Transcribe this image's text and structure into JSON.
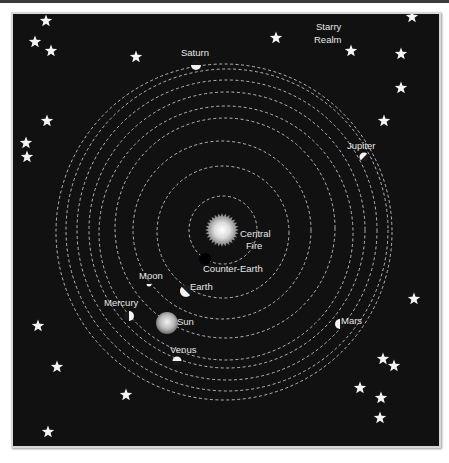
{
  "colors": {
    "background": "#111111",
    "frame": "#d8d8d8",
    "orbit": "#d0d0d0",
    "star": "#f4f4f4",
    "label": "#e6e6e6"
  },
  "labels": {
    "central_fire": [
      "Central",
      "Fire"
    ],
    "counter_earth": "Counter-Earth",
    "moon": "Moon",
    "earth": "Earth",
    "mercury": "Mercury",
    "sun": "Sun",
    "venus": "Venus",
    "mars": "Mars",
    "jupiter": "Jupiter",
    "saturn": "Saturn",
    "starry_realm": [
      "Starry",
      "Realm"
    ]
  },
  "orbits": [
    {
      "body": "counter-earth",
      "cx": 223,
      "cy": 230,
      "r": 34
    },
    {
      "body": "moon",
      "cx": 223,
      "cy": 232,
      "r": 66
    },
    {
      "body": "earth",
      "cx": 222,
      "cy": 230,
      "r": 89
    },
    {
      "body": "mercury",
      "cx": 225,
      "cy": 228,
      "r": 110
    },
    {
      "body": "sun",
      "cx": 226,
      "cy": 233,
      "r": 127
    },
    {
      "body": "venus",
      "cx": 227,
      "cy": 230,
      "r": 138
    },
    {
      "body": "mars",
      "cx": 227,
      "cy": 230,
      "r": 150
    },
    {
      "body": "jupiter",
      "cx": 227,
      "cy": 230,
      "r": 161
    },
    {
      "body": "saturn",
      "cx": 224,
      "cy": 232,
      "r": 168
    }
  ],
  "stars": [
    [
      46,
      21
    ],
    [
      35,
      42
    ],
    [
      51,
      51
    ],
    [
      136,
      57
    ],
    [
      276,
      38
    ],
    [
      351,
      51
    ],
    [
      401,
      54
    ],
    [
      412,
      17
    ],
    [
      401,
      88
    ],
    [
      384,
      121
    ],
    [
      47,
      121
    ],
    [
      26,
      143
    ],
    [
      27,
      157
    ],
    [
      414,
      299
    ],
    [
      38,
      326
    ],
    [
      57,
      367
    ],
    [
      126,
      395
    ],
    [
      383,
      359
    ],
    [
      394,
      366
    ],
    [
      360,
      388
    ],
    [
      381,
      398
    ],
    [
      380,
      418
    ],
    [
      48,
      432
    ]
  ]
}
